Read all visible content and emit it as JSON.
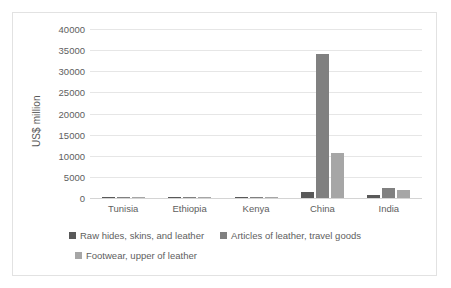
{
  "chart_data": {
    "type": "bar",
    "title": "",
    "xlabel": "",
    "ylabel": "US$ million",
    "ylim": [
      0,
      40000
    ],
    "ytick_step": 5000,
    "yticks": [
      "40000",
      "35000",
      "30000",
      "25000",
      "20000",
      "15000",
      "10000",
      "5000",
      "0"
    ],
    "grid": true,
    "legend_position": "bottom",
    "categories": [
      "Tunisia",
      "Ethiopia",
      "Kenya",
      "China",
      "India"
    ],
    "series": [
      {
        "name": "Raw hides, skins, and leather",
        "color": "#595959",
        "values": [
          30,
          60,
          40,
          1400,
          600
        ]
      },
      {
        "name": "Articles of leather, travel goods",
        "color": "#808080",
        "values": [
          60,
          20,
          10,
          34000,
          2300
        ]
      },
      {
        "name": "Footwear, upper of leather",
        "color": "#a6a6a6",
        "values": [
          300,
          30,
          20,
          10650,
          1800
        ]
      }
    ]
  },
  "legend": {
    "items": [
      {
        "label": "Raw hides, skins, and leather",
        "color": "#595959"
      },
      {
        "label": "Articles of leather, travel goods",
        "color": "#808080"
      },
      {
        "label": "Footwear, upper of leather",
        "color": "#a6a6a6"
      }
    ]
  }
}
